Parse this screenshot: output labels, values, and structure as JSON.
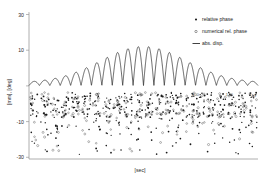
{
  "chart_data": {
    "type": "line",
    "title": "",
    "subtitle": "",
    "xlabel": "[sec]",
    "ylabel": "[mm], [deg]",
    "grid": false,
    "legend_position": "top-right",
    "xlim": [
      0,
      135
    ],
    "ylim": [
      -32,
      32
    ],
    "yticks": [
      30,
      10,
      -10,
      -30
    ],
    "ytick_labels": [
      "30",
      "10",
      "-10",
      "-30"
    ],
    "xticks": [],
    "xtick_labels": [],
    "series": [
      {
        "name": "relative phase",
        "type": "scatter",
        "marker": "filled-circle",
        "color": "#1a1a1a",
        "n_points": 430,
        "y_range": [
          -30,
          -1
        ],
        "description": "dense vertical striations below zero, bulk between -4 and -16, sparse tail to -30"
      },
      {
        "name": "numerical rel. phase",
        "type": "scatter",
        "marker": "open-circle",
        "color": "#4a4a4a",
        "n_points": 210,
        "y_range": [
          -29,
          -2
        ],
        "description": "hollow markers interleaved with the filled relative-phase cloud"
      },
      {
        "name": "abs. disp.",
        "type": "line",
        "marker": "line",
        "color": "#111111",
        "description": "rectified sinusoid, 22 lobes, gaussian envelope peaking near 17 at mid-record, tapering to ~1 at both ends",
        "n_lobes": 22,
        "envelope_peak": 17.0,
        "envelope_edge": 1.2,
        "x": [
          0,
          6,
          12,
          18,
          24,
          30,
          36,
          42,
          48,
          54,
          60,
          66,
          72,
          78,
          84,
          90,
          96,
          102,
          108,
          114,
          120,
          126,
          132
        ],
        "peak_values": [
          1.6,
          2.6,
          3.7,
          5.2,
          6.9,
          8.8,
          10.7,
          12.5,
          14.1,
          15.4,
          16.4,
          17.0,
          16.9,
          16.2,
          15.1,
          13.6,
          11.9,
          10.0,
          8.1,
          6.2,
          4.4,
          2.8,
          1.5
        ]
      }
    ],
    "annotations": [
      {
        "text": "100",
        "x": 96,
        "y": -4.5
      },
      {
        "text": "120",
        "x": 116,
        "y": -4.5
      },
      {
        "text": "13",
        "x": 131,
        "y": -5.0
      }
    ]
  },
  "legend": {
    "items": [
      {
        "label": "relative phase",
        "marker": "filled-circle"
      },
      {
        "label": "numerical rel. phase",
        "marker": "open-circle"
      },
      {
        "label": "abs. disp.",
        "marker": "line"
      }
    ]
  },
  "axes": {
    "y_title": "[mm], [deg]",
    "x_title": "[sec]",
    "y_tick_0": "30",
    "y_tick_1": "10",
    "y_tick_2": "-10",
    "y_tick_3": "-30"
  },
  "colors": {
    "background": "#ffffff",
    "axis": "#9a9a9a",
    "line": "#111111",
    "marker_filled": "#1a1a1a",
    "marker_open": "#4a4a4a",
    "text": "#2b2b2b"
  }
}
